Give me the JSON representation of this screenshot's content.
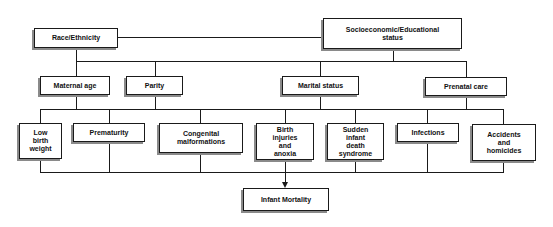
{
  "diagram": {
    "type": "flowchart",
    "top_level": [
      {
        "id": "race",
        "label": "Race/Ethnicity"
      },
      {
        "id": "ses",
        "label": "Socioeconomic/Educational\nstatus"
      }
    ],
    "intermediate": [
      {
        "id": "maternal_age",
        "label": "Maternal age"
      },
      {
        "id": "parity",
        "label": "Parity"
      },
      {
        "id": "marital",
        "label": "Marital status"
      },
      {
        "id": "prenatal",
        "label": "Prenatal care"
      }
    ],
    "causes": [
      {
        "id": "lbw",
        "label": "Low\nbirth\nweight"
      },
      {
        "id": "prematurity",
        "label": "Prematurity"
      },
      {
        "id": "congenital",
        "label": "Congenital\nmalformations"
      },
      {
        "id": "birth_injuries",
        "label": "Birth\ninjuries\nand\nanoxia"
      },
      {
        "id": "sids",
        "label": "Sudden\ninfant\ndeath\nsyndrome"
      },
      {
        "id": "infections",
        "label": "Infections"
      },
      {
        "id": "accidents",
        "label": "Accidents\nand\nhomicides"
      }
    ],
    "outcome": {
      "id": "infant_mortality",
      "label": "Infant Mortality"
    },
    "edges": [
      [
        "race",
        "ses"
      ],
      [
        "race",
        "intermediate"
      ],
      [
        "ses",
        "intermediate"
      ],
      [
        "intermediate",
        "causes"
      ],
      [
        "causes",
        "infant_mortality"
      ]
    ]
  }
}
